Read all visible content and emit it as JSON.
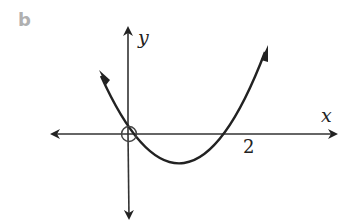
{
  "part_label": "b",
  "axes": {
    "x_label": "x",
    "y_label": "y"
  },
  "intercepts": {
    "root_label": "2",
    "origin_marked": "open circle at origin"
  },
  "curve": {
    "type": "parabola",
    "opens": "up",
    "roots": [
      0,
      2
    ],
    "equation_form": "y = a x (x - 2), a > 0"
  },
  "colors": {
    "ink": "#222222",
    "part_label": "#b0b0b0"
  }
}
